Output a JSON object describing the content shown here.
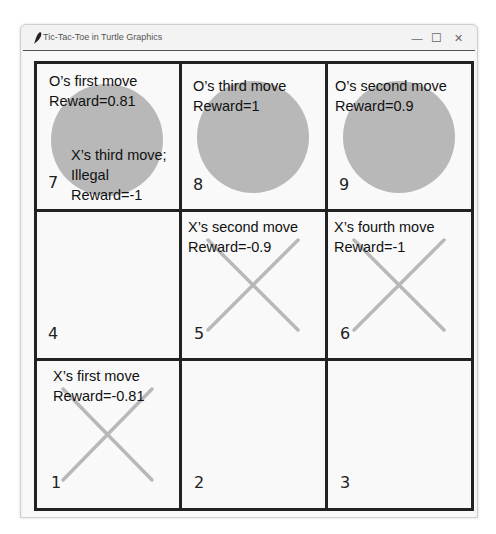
{
  "window": {
    "title": "Tic-Tac-Toe in Turtle Graphics",
    "controls": {
      "minimize": "—",
      "maximize": "☐",
      "close": "✕"
    }
  },
  "colors": {
    "grid_line": "#222222",
    "mark": "#b8b8b8",
    "canvas_bg": "#f9f9f9"
  },
  "cells": [
    {
      "number": "7",
      "mark": "O",
      "annotation": [
        "O’s first move",
        "Reward=0.81"
      ],
      "extra_annotation": [
        "X’s third move;",
        "Illegal",
        "Reward=-1"
      ]
    },
    {
      "number": "8",
      "mark": "O",
      "annotation": [
        "O’s third move",
        "Reward=1"
      ]
    },
    {
      "number": "9",
      "mark": "O",
      "annotation": [
        "O’s second move",
        "Reward=0.9"
      ]
    },
    {
      "number": "4",
      "mark": "",
      "annotation": []
    },
    {
      "number": "5",
      "mark": "X",
      "annotation": [
        "X’s second move",
        "Reward=-0.9"
      ]
    },
    {
      "number": "6",
      "mark": "X",
      "annotation": [
        "X’s fourth move",
        "Reward=-1"
      ]
    },
    {
      "number": "1",
      "mark": "X",
      "annotation": [
        "X’s first move",
        "Reward=-0.81"
      ]
    },
    {
      "number": "2",
      "mark": "",
      "annotation": []
    },
    {
      "number": "3",
      "mark": "",
      "annotation": []
    }
  ]
}
